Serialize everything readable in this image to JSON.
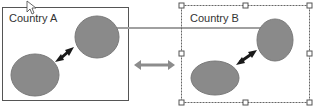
{
  "diagram": {
    "country_a": {
      "label": "Country A"
    },
    "country_b": {
      "label": "Country B"
    },
    "colors": {
      "ellipse_fill": "#8a8a8a",
      "ellipse_stroke": "#7a7a7a",
      "box_border": "#555555",
      "connector_line": "#a0a0a0",
      "inner_arrow": "#1a1a1a",
      "middle_arrow": "#8c8c8c",
      "selection_border": "#666666"
    }
  }
}
